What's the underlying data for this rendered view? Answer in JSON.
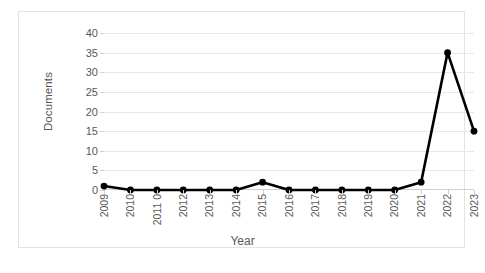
{
  "chart_data": {
    "type": "line",
    "title": "",
    "xlabel": "Year",
    "ylabel": "Documents",
    "categories": [
      "2009",
      "2010",
      "2011 0",
      "2012",
      "2013",
      "2014",
      "2015",
      "2016",
      "2017",
      "2018",
      "2019",
      "2020",
      "2021",
      "2022",
      "2023"
    ],
    "values": [
      1,
      0,
      0,
      0,
      0,
      0,
      2,
      0,
      0,
      0,
      0,
      0,
      2,
      35,
      15
    ],
    "series": [
      {
        "name": "Documents",
        "values": [
          1,
          0,
          0,
          0,
          0,
          0,
          2,
          0,
          0,
          0,
          0,
          0,
          2,
          35,
          15
        ]
      }
    ],
    "ylim": [
      0,
      40
    ],
    "y_ticks": [
      0,
      5,
      10,
      15,
      20,
      25,
      30,
      35,
      40
    ],
    "y_tick_labels": [
      "0",
      "5",
      "10",
      "15",
      "20",
      "25",
      "30",
      "35",
      "40"
    ],
    "grid": true,
    "legend": "none",
    "marker": "circle",
    "line_color": "#000000",
    "marker_color": "#000000",
    "grid_color": "#e8e8e8",
    "axis_label_color": "#595959",
    "plot_background": "#ffffff",
    "frame_border_color": "#e3e3e3"
  }
}
